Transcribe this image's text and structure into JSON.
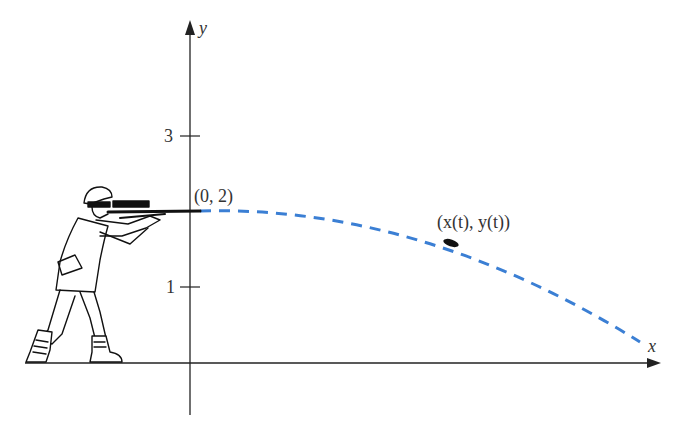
{
  "diagram": {
    "axes": {
      "x_label": "x",
      "y_label": "y",
      "y_ticks": [
        {
          "label": "3",
          "value": 3
        },
        {
          "label": "1",
          "value": 1
        }
      ]
    },
    "points": {
      "start_label": "(0, 2)",
      "moving_label": "(x(t), y(t))"
    },
    "figure": "rifleman-aiming",
    "colors": {
      "trajectory": "#3b7fd4",
      "axis": "#222222",
      "bullet": "#111111"
    }
  }
}
